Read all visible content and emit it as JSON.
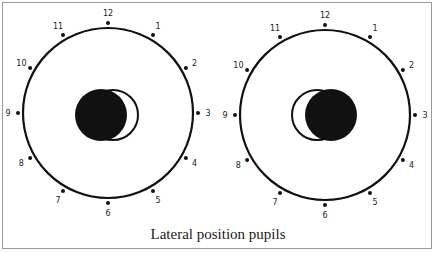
{
  "figure": {
    "caption": "Lateral position pupils",
    "border_color": "#9a9a9a",
    "ink_color": "#111111",
    "clock_numbers": [
      "12",
      "1",
      "2",
      "3",
      "4",
      "5",
      "6",
      "7",
      "8",
      "9",
      "10",
      "11"
    ],
    "eyes": [
      {
        "name": "left-eye",
        "cx": 108,
        "cy": 113,
        "r": 85,
        "pupil_fill": {
          "cx": 101,
          "cy": 115,
          "r": 26
        },
        "pupil_outline": {
          "cx": 113,
          "cy": 115,
          "r": 25
        }
      },
      {
        "name": "right-eye",
        "cx": 325,
        "cy": 115,
        "r": 85,
        "pupil_fill": {
          "cx": 331,
          "cy": 115,
          "r": 26
        },
        "pupil_outline": {
          "cx": 317,
          "cy": 115,
          "r": 25
        }
      }
    ]
  }
}
